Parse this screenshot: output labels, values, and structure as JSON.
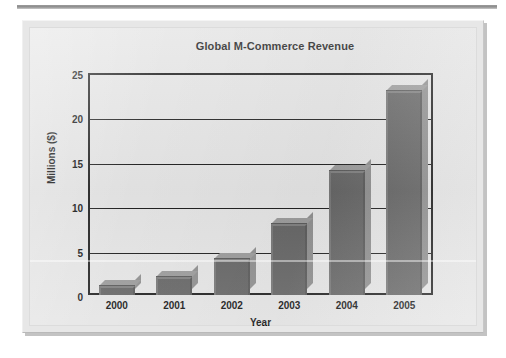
{
  "figure": {
    "background_color": "#e4e4e4",
    "frame_color": "#dcdcdc"
  },
  "chart_data": {
    "type": "bar",
    "title": "Global M-Commerce Revenue",
    "xlabel": "Year",
    "ylabel": "Millions ($)",
    "categories": [
      "2000",
      "2001",
      "2002",
      "2003",
      "2004",
      "2005"
    ],
    "values": [
      1,
      2,
      4,
      8,
      14,
      23
    ],
    "ylim": [
      0,
      25
    ],
    "ytick_labels": [
      "0",
      "5",
      "10",
      "15",
      "20",
      "25"
    ],
    "ytick_values": [
      0,
      5,
      10,
      15,
      20,
      25
    ],
    "grid": true,
    "grid_axis": "y",
    "legend": null,
    "bar_color": "#646464",
    "bar_top_color": "#9a9a9a",
    "bar_side_color": "#8e8e8e",
    "axis_color": "#1d1d1d",
    "style": "3d-bar"
  }
}
